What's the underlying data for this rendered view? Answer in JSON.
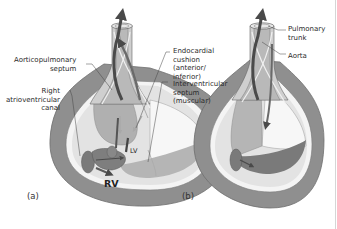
{
  "figure": {
    "panels": [
      {
        "id": "a",
        "label": "(a)",
        "chambers": {
          "rv": "RV",
          "lv": "LV"
        },
        "annotations": [
          {
            "key": "aorticopulmonary_septum",
            "text": "Aorticopulmonary\nseptum"
          },
          {
            "key": "right_av_canal",
            "text": "Right\natrioventricular\ncanal"
          },
          {
            "key": "endocardial_cushion",
            "text": "Endocardial\ncushion\n(anterior/\ninferior)"
          },
          {
            "key": "interventricular_septum",
            "text": "Interventricular\nseptum\n(muscular)"
          }
        ]
      },
      {
        "id": "b",
        "label": "(b)",
        "annotations": [
          {
            "key": "pulmonary_trunk",
            "text": "Pulmonary\ntrunk"
          },
          {
            "key": "aorta",
            "text": "Aorta"
          }
        ]
      }
    ],
    "colors": {
      "myocardium": "#8f8f8f",
      "myocardium_edge": "#6e6e6e",
      "inner_lining": "#f4f4f4",
      "cavity_light": "#e3e3e3",
      "cavity_mid": "#c6c6c6",
      "cushion": "#7a7a7a",
      "arrow_dark": "#4a4a4a",
      "trunk_fill": "#b9b9b9",
      "leader_line": "#444444"
    }
  }
}
